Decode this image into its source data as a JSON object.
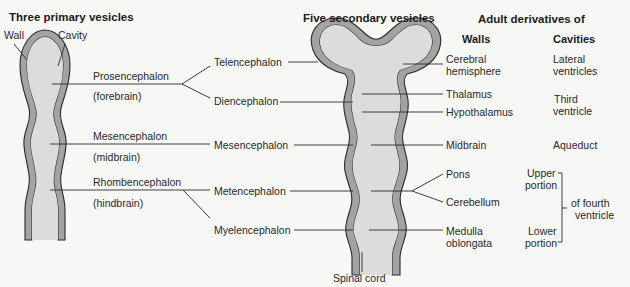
{
  "headings": {
    "primary": "Three primary vesicles",
    "secondary": "Five secondary vesicles",
    "adult": "Adult derivatives of",
    "walls": "Walls",
    "cavities": "Cavities"
  },
  "primary_labels": {
    "wall": "Wall",
    "cavity": "Cavity",
    "prosencephalon": "Prosencephalon",
    "forebrain": "(forebrain)",
    "mesencephalon": "Mesencephalon",
    "midbrain": "(midbrain)",
    "rhombencephalon": "Rhombencephalon",
    "hindbrain": "(hindbrain)"
  },
  "secondary_labels": {
    "telencephalon": "Telencephalon",
    "diencephalon": "Diencephalon",
    "mesencephalon": "Mesencephalon",
    "metencephalon": "Metencephalon",
    "myelencephalon": "Myelencephalon",
    "spinal_cord": "Spinal cord"
  },
  "walls": {
    "cerebral_1": "Cerebral",
    "cerebral_2": "hemisphere",
    "thalamus": "Thalamus",
    "hypothalamus": "Hypothalamus",
    "midbrain": "Midbrain",
    "pons": "Pons",
    "cerebellum": "Cerebellum",
    "medulla_1": "Medulla",
    "medulla_2": "oblongata"
  },
  "cavities": {
    "lateral_1": "Lateral",
    "lateral_2": "ventricles",
    "third_1": "Third",
    "third_2": "ventricle",
    "aqueduct": "Aqueduct",
    "upper_1": "Upper",
    "upper_2": "portion",
    "lower_1": "Lower",
    "lower_2": "portion",
    "fourth_1": "of fourth",
    "fourth_2": "ventricle"
  },
  "colors": {
    "wall_fill": "#a3a3a3",
    "cavity_fill": "#dcdcdc",
    "outline": "#2a2a2a",
    "background": "#f7f7f5"
  }
}
